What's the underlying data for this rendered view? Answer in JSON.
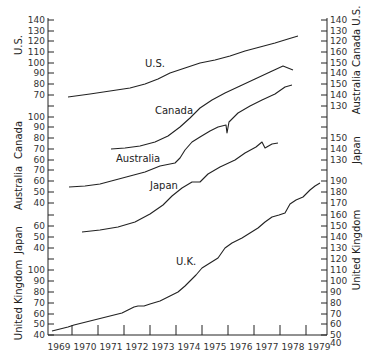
{
  "chart_data": {
    "type": "line",
    "title": "",
    "xlabel": "",
    "ylabel": "",
    "x_ticks": [
      "1969",
      "1970",
      "1971",
      "1972",
      "1973",
      "1974",
      "1975",
      "1976",
      "1977",
      "1978",
      "1979"
    ],
    "grid": false,
    "legend": "inline labels",
    "left_axes": [
      {
        "name": "U.S.",
        "ticks": [
          70,
          80,
          90,
          100,
          110,
          120,
          130,
          140
        ]
      },
      {
        "name": "Canada",
        "ticks": [
          60,
          70,
          80,
          90,
          100
        ]
      },
      {
        "name": "Australia",
        "ticks": [
          40,
          50,
          60,
          70
        ]
      },
      {
        "name": "Japan",
        "ticks": [
          40,
          50,
          60
        ]
      },
      {
        "name": "United Kingdom",
        "ticks": [
          40,
          50,
          60,
          70,
          80,
          90,
          100
        ]
      }
    ],
    "right_axes": [
      {
        "name": "U.S.",
        "ticks": [
          120,
          130,
          140
        ]
      },
      {
        "name": "Canada",
        "ticks": [
          140,
          150,
          160
        ]
      },
      {
        "name": "Australia",
        "ticks": [
          130,
          140,
          150
        ]
      },
      {
        "name": "Japan",
        "ticks": [
          130,
          140,
          150
        ]
      },
      {
        "name": "United Kingdom",
        "ticks": [
          40,
          50,
          60,
          70,
          80,
          90,
          100,
          110,
          120,
          130,
          140,
          150,
          160,
          170,
          180,
          190
        ]
      }
    ],
    "series": [
      {
        "name": "U.S.",
        "x": [
          1969.0,
          1970.0,
          1971.0,
          1972.0,
          1973.0,
          1974.0,
          1975.0,
          1976.0,
          1977.0,
          1978.0,
          1978.7
        ],
        "values": [
          70,
          72,
          75,
          79,
          86,
          95,
          102,
          107,
          114,
          124,
          132
        ]
      },
      {
        "name": "Canada",
        "x": [
          1971.0,
          1972.0,
          1973.0,
          1974.0,
          1975.0,
          1976.0,
          1977.0,
          1978.0,
          1978.7
        ],
        "values": [
          62,
          64,
          68,
          74,
          84,
          94,
          104,
          115,
          122
        ]
      },
      {
        "name": "Australia",
        "x": [
          1969.0,
          1970.0,
          1971.0,
          1972.0,
          1973.0,
          1974.0,
          1975.0,
          1975.5,
          1975.55,
          1976.0,
          1977.0,
          1978.0,
          1978.6
        ],
        "values": [
          51,
          53,
          56,
          59,
          63,
          74,
          88,
          93,
          82,
          100,
          110,
          118,
          121
        ]
      },
      {
        "name": "Japan",
        "x": [
          1969.8,
          1970.5,
          1971.5,
          1972.5,
          1973.5,
          1974.2,
          1974.5,
          1975.0,
          1976.0,
          1977.0,
          1977.3,
          1977.5,
          1977.9
        ],
        "values": [
          53,
          54,
          56,
          60,
          70,
          80,
          79,
          85,
          92,
          103,
          106,
          104,
          105
        ]
      },
      {
        "name": "U.K.",
        "x": [
          1969.0,
          1969.5,
          1970.0,
          1970.5,
          1971.0,
          1971.5,
          1972.0,
          1972.5,
          1973.0,
          1973.5,
          1974.0,
          1974.5,
          1975.0,
          1975.5,
          1976.0,
          1976.5,
          1977.0,
          1977.5,
          1978.0,
          1978.5,
          1978.9
        ],
        "values": [
          44,
          46,
          49,
          51,
          53,
          55,
          58,
          61,
          66,
          72,
          82,
          92,
          102,
          112,
          122,
          130,
          137,
          146,
          154,
          164,
          172
        ]
      }
    ],
    "annotations": [
      "U.S.",
      "Canada",
      "Australia",
      "Japan",
      "U.K."
    ]
  },
  "labels": {
    "us": "U.S.",
    "canada": "Canada",
    "australia": "Australia",
    "japan": "Japan",
    "uk": "U.K.",
    "left_us": "U.S.",
    "left_canada": "Canada",
    "left_australia": "Australia",
    "left_japan": "Japan",
    "left_uk": "United Kingdom",
    "right_us_canada_australia": "Australia Canada U.S.",
    "right_japan": "Japan",
    "right_uk": "United Kingdom"
  }
}
